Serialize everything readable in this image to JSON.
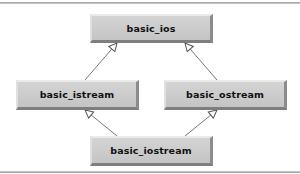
{
  "diagram": {
    "type": "class-inheritance",
    "nodes": [
      {
        "id": "basic_ios",
        "label": "basic_ios"
      },
      {
        "id": "basic_istream",
        "label": "basic_istream"
      },
      {
        "id": "basic_ostream",
        "label": "basic_ostream"
      },
      {
        "id": "basic_iostream",
        "label": "basic_iostream"
      }
    ],
    "edges": [
      {
        "from": "basic_istream",
        "to": "basic_ios",
        "style": "hollow-triangle-arrow"
      },
      {
        "from": "basic_ostream",
        "to": "basic_ios",
        "style": "hollow-triangle-arrow"
      },
      {
        "from": "basic_iostream",
        "to": "basic_istream",
        "style": "hollow-triangle-arrow"
      },
      {
        "from": "basic_iostream",
        "to": "basic_ostream",
        "style": "hollow-triangle-arrow"
      }
    ],
    "colors": {
      "node_fill": "#c8c8c8",
      "edge": "#555555",
      "text": "#111111"
    }
  }
}
